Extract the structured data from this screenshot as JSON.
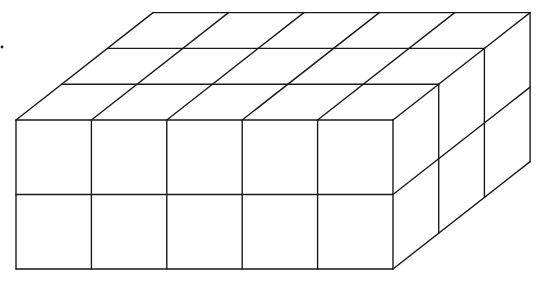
{
  "diagram": {
    "type": "rectangular-prism-of-unit-cubes",
    "dimensions": {
      "length": 5,
      "depth": 3,
      "height": 2
    },
    "unit_cube_count": 30,
    "colors": {
      "line": "#1a1a1a",
      "background": "#ffffff"
    },
    "geometry": {
      "front_origin": [
        16,
        120
      ],
      "unit_width": 75.4,
      "unit_height": 74.5,
      "depth_vector": [
        45.7,
        -35.8
      ]
    },
    "faces": [
      "front",
      "top",
      "right-side"
    ],
    "marker_dot": [
      2,
      47
    ]
  }
}
